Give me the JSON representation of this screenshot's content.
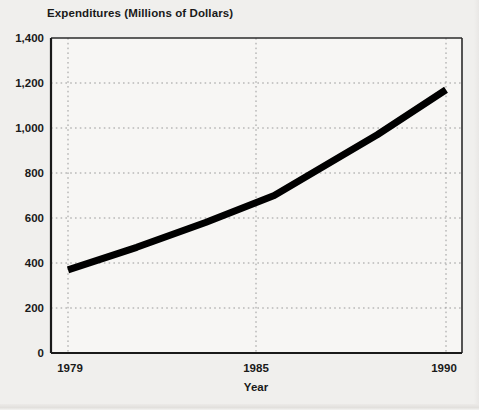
{
  "chart_data": {
    "type": "line",
    "title": "Expenditures (Millions of Dollars)",
    "xlabel": "Year",
    "ylabel": "",
    "x": [
      1979,
      1981,
      1983,
      1985,
      1987,
      1988,
      1990
    ],
    "values": [
      370,
      470,
      580,
      700,
      880,
      970,
      1170
    ],
    "series": [
      {
        "name": "Expenditures",
        "values": [
          370,
          470,
          580,
          700,
          880,
          970,
          1170
        ]
      }
    ],
    "xlim": [
      1979,
      1990
    ],
    "ylim": [
      0,
      1400
    ],
    "x_tick_values": [
      1979,
      1985,
      1990
    ],
    "x_tick_labels": [
      "1979",
      "1985",
      "1990"
    ],
    "y_tick_values": [
      0,
      200,
      400,
      600,
      800,
      1000,
      1200,
      1400
    ],
    "y_tick_labels": [
      "0",
      "200",
      "400",
      "600",
      "800",
      "1,000",
      "1,200",
      "1,400"
    ],
    "grid": true,
    "grid_style": "dotted",
    "legend": false,
    "legend_position": "none",
    "line_color": "#000000",
    "grid_color": "#9a9a9a",
    "axis_color": "#1a1a1a",
    "background_color": "#f0efed",
    "plot_background_color": "#f7f6f4"
  }
}
